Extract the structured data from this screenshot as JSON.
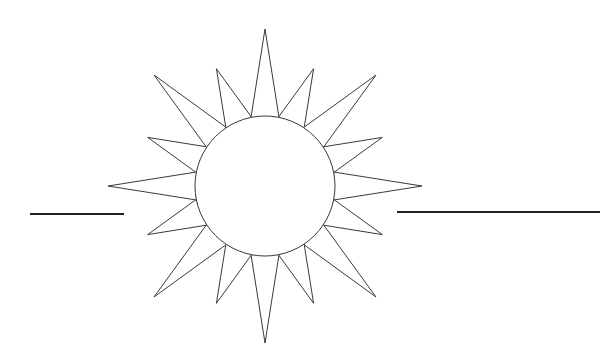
{
  "illustration": {
    "subject": "sun",
    "background": "#ffffff",
    "stroke_color": "#3a3a3a",
    "stroke_width": 1,
    "center": [
      265,
      186
    ],
    "disc_radius": 70,
    "ray_count": 16,
    "long_ray_length": 157,
    "short_ray_length": 127,
    "ray_half_width_deg": 11.5,
    "horizon_lines": [
      {
        "x1": 30,
        "x2": 124,
        "y": 214,
        "width": 2.2
      },
      {
        "x1": 397,
        "x2": 600,
        "y": 212,
        "width": 2.2
      }
    ]
  }
}
